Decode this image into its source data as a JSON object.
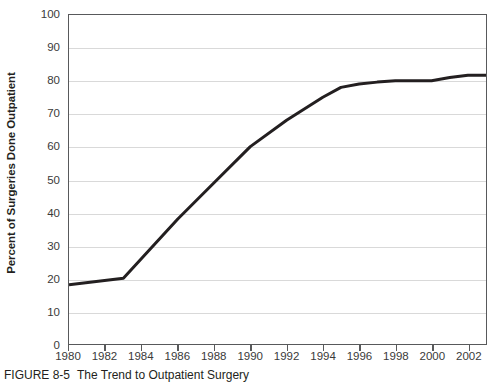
{
  "figure": {
    "caption_label": "FIGURE 8-5",
    "caption_text": "The Trend to Outpatient Surgery"
  },
  "chart_data": {
    "type": "line",
    "title": "",
    "subtitle": "",
    "xlabel": "",
    "ylabel": "Percent of Surgeries Done Outpatient",
    "xlim": [
      1980,
      2003
    ],
    "ylim": [
      0,
      100
    ],
    "grid": true,
    "legend": "none",
    "line_color": "#231f20",
    "line_width": 3,
    "x_tick_labels": [
      "1980",
      "1982",
      "1984",
      "1986",
      "1988",
      "1990",
      "1992",
      "1994",
      "1996",
      "1998",
      "2000",
      "2002"
    ],
    "x_tick_values": [
      1980,
      1982,
      1984,
      1986,
      1988,
      1990,
      1992,
      1994,
      1996,
      1998,
      2000,
      2002
    ],
    "y_tick_labels": [
      "0",
      "10",
      "20",
      "30",
      "40",
      "50",
      "60",
      "70",
      "80",
      "90",
      "100"
    ],
    "y_tick_values": [
      0,
      10,
      20,
      30,
      40,
      50,
      60,
      70,
      80,
      90,
      100
    ],
    "series": [
      {
        "name": "Percent of Surgeries Done Outpatient",
        "x": [
          1980,
          1983,
          1984,
          1986,
          1988,
          1990,
          1992,
          1994,
          1995,
          1996,
          1997,
          1998,
          1999,
          2000,
          2001,
          2002,
          2003
        ],
        "values": [
          18,
          20,
          26,
          38,
          49,
          60,
          68,
          75,
          78,
          79,
          79.6,
          80,
          80,
          80,
          81,
          81.7,
          81.7
        ]
      }
    ]
  }
}
